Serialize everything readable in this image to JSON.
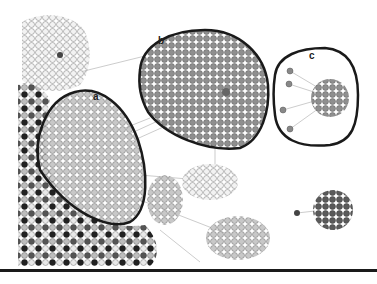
{
  "figure": {
    "background": "#ffffff",
    "outline_color": "#1a1a1a",
    "edge_color": "#aaaaaa",
    "node_stroke": "#777777"
  },
  "clusters": [
    {
      "id": "a",
      "label": "a",
      "fill": "#cfcfcf",
      "label_x": 93,
      "label_y": 92
    },
    {
      "id": "b",
      "label": "b",
      "fill": "#8e8e8e",
      "label_x": 158,
      "label_y": 36
    },
    {
      "id": "c",
      "label": "c",
      "fill": "#8e8e8e",
      "label_x": 309,
      "label_y": 51
    }
  ],
  "unlabeled_groups": [
    {
      "name": "top-left-light-cluster",
      "fill": "#efefef"
    },
    {
      "name": "left-dense-mixed-mass",
      "fill": "#6a6a6a"
    },
    {
      "name": "bottom-center-light-star",
      "fill": "#e6e6e6"
    },
    {
      "name": "bottom-center-gray-star",
      "fill": "#b5b5b5"
    },
    {
      "name": "right-isolated-dark-cluster",
      "fill": "#555555"
    }
  ]
}
